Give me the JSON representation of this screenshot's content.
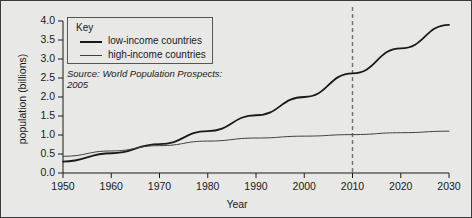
{
  "chart_data": {
    "type": "line",
    "title": "",
    "xlabel": "Year",
    "ylabel": "population (billions)",
    "xlim": [
      1950,
      2030
    ],
    "ylim": [
      0.0,
      4.0
    ],
    "grid": false,
    "legend_position": "top-left",
    "legend_title": "Key",
    "x": [
      1950,
      1960,
      1970,
      1980,
      1990,
      2000,
      2010,
      2020,
      2030
    ],
    "xticks": [
      "1950",
      "1960",
      "1970",
      "1980",
      "1990",
      "2000",
      "2010",
      "2020",
      "2030"
    ],
    "yticks": [
      "0.0",
      "0.5",
      "1.0",
      "1.5",
      "2.0",
      "2.5",
      "3.0",
      "3.5",
      "4.0"
    ],
    "series": [
      {
        "name": "low-income countries",
        "color": "#1a1a1a",
        "width": 1.8,
        "values": [
          0.3,
          0.52,
          0.76,
          1.1,
          1.52,
          2.0,
          2.62,
          3.28,
          3.9
        ]
      },
      {
        "name": "high-income countries",
        "color": "#3f3f3f",
        "width": 1.0,
        "values": [
          0.44,
          0.58,
          0.72,
          0.84,
          0.92,
          0.97,
          1.01,
          1.06,
          1.1
        ]
      }
    ],
    "annotations": [
      {
        "type": "vline",
        "name": "projection-divider",
        "x": 2010,
        "style": "dashed",
        "color": "#6f6f6f"
      }
    ],
    "source_note": "Source: World Population Prospects: 2005"
  }
}
